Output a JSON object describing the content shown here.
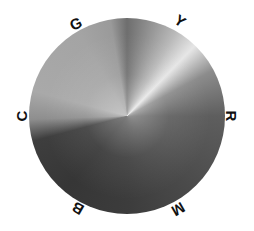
{
  "diagram": {
    "type": "hue-circle",
    "rendering": "grayscale",
    "labels": {
      "red": "R",
      "yellow": "Y",
      "green": "G",
      "cyan": "C",
      "blue": "B",
      "magenta": "M"
    },
    "tones": {
      "yellow": "#e6e6e6",
      "green": "#a9a9a9",
      "cyan": "#a4a4a4",
      "red": "#5e5e5e",
      "magenta": "#3c3c3c",
      "blue": "#363636"
    }
  }
}
